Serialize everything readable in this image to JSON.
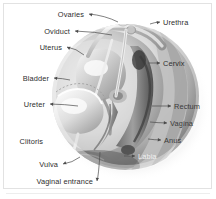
{
  "figure": {
    "kind": "anatomical-illustration",
    "style": "grayscale medical illustration on white background",
    "width": 216,
    "height": 199,
    "colors": {
      "page_background": "#ffffff",
      "border": "#e2e2e2",
      "label_text": "#2e2e2e",
      "label_text_light": "#f0f0f0",
      "leader_line": "#4a4a4a",
      "illustration_light": "#f2f2f2",
      "illustration_mid": "#b6b6b6",
      "illustration_dark": "#4d4d4d",
      "illustration_shadow": "#2b2b2b"
    }
  },
  "labels": {
    "left": [
      {
        "text": "Ovaries",
        "x": 84,
        "y": 14,
        "leader": {
          "x1": 89,
          "y1": 14,
          "x2": 118,
          "y2": 22
        }
      },
      {
        "text": "Oviduct",
        "x": 70,
        "y": 31,
        "leader": {
          "x1": 75,
          "y1": 31,
          "x2": 112,
          "y2": 35
        }
      },
      {
        "text": "Uterus",
        "x": 62,
        "y": 47,
        "leader": {
          "x1": 67,
          "y1": 47,
          "x2": 84,
          "y2": 55
        }
      },
      {
        "text": "Bladder",
        "x": 49,
        "y": 78,
        "leader": {
          "x1": 54,
          "y1": 78,
          "x2": 70,
          "y2": 80
        }
      },
      {
        "text": "Ureter",
        "x": 45,
        "y": 104,
        "leader": {
          "x1": 50,
          "y1": 104,
          "x2": 78,
          "y2": 106
        }
      },
      {
        "text": "Clitoris",
        "x": 43,
        "y": 141,
        "leader": null
      },
      {
        "text": "Vulva",
        "x": 58,
        "y": 164,
        "leader": {
          "x1": 63,
          "y1": 164,
          "x2": 80,
          "y2": 157
        }
      },
      {
        "text": "Vaginal entrance",
        "x": 93,
        "y": 181,
        "leader": {
          "x1": 97,
          "y1": 181,
          "x2": 100,
          "y2": 152
        }
      }
    ],
    "right": [
      {
        "text": "Urethra",
        "x": 163,
        "y": 22,
        "leader": {
          "x1": 160,
          "y1": 22,
          "x2": 150,
          "y2": 24
        }
      },
      {
        "text": "Cervix",
        "x": 163,
        "y": 63,
        "leader": {
          "x1": 160,
          "y1": 63,
          "x2": 148,
          "y2": 63
        }
      },
      {
        "text": "Rectum",
        "x": 174,
        "y": 106,
        "leader": {
          "x1": 171,
          "y1": 106,
          "x2": 152,
          "y2": 106
        }
      },
      {
        "text": "Vagina",
        "x": 170,
        "y": 123,
        "leader": {
          "x1": 167,
          "y1": 123,
          "x2": 150,
          "y2": 122
        }
      },
      {
        "text": "Anus",
        "x": 164,
        "y": 140,
        "leader": {
          "x1": 161,
          "y1": 140,
          "x2": 148,
          "y2": 139
        }
      },
      {
        "text": "Labia",
        "x": 138,
        "y": 156,
        "leader": {
          "x1": 135,
          "y1": 156,
          "x2": 124,
          "y2": 156
        }
      }
    ]
  }
}
